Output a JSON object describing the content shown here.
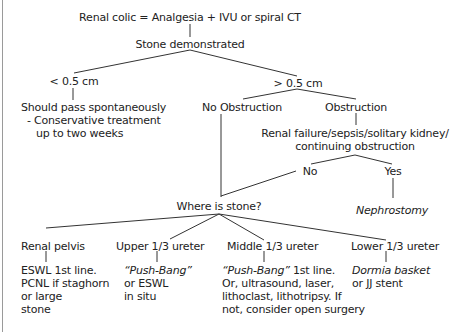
{
  "diagram": {
    "type": "flowchart",
    "title": "Renal colic = Analgesia + IVU or spiral CT",
    "nodes": {
      "stone_demonstrated": "Stone demonstrated",
      "lt_05": "< 0.5 cm",
      "lt_05_outcome": [
        "Should pass spontaneously",
        "- Conservative treatment",
        "up to two weeks"
      ],
      "gt_05": "> 0.5 cm",
      "no_obstruction": "No Obstruction",
      "obstruction": "Obstruction",
      "complications": [
        "Renal failure/sepsis/solitary kidney/",
        "continuing obstruction"
      ],
      "no": "No",
      "yes": "Yes",
      "nephrostomy": "Nephrostomy",
      "where_is_stone": "Where is stone?",
      "locations": [
        {
          "label": "Renal pelvis",
          "treatment": [
            "ESWL 1st line.",
            "PCNL if staghorn",
            "or large",
            "stone"
          ]
        },
        {
          "label": "Upper 1/3 ureter",
          "treatment_italic": "“Push-Bang”",
          "treatment": [
            "or ESWL",
            "in situ"
          ]
        },
        {
          "label": "Middle 1/3 ureter",
          "treatment_italic": "“Push-Bang”",
          "treatment_first_suffix": " 1st line.",
          "treatment": [
            "Or, ultrasound, laser,",
            "lithoclast, lithotripsy. If",
            "not, consider open surgery"
          ]
        },
        {
          "label": "Lower 1/3 ureter",
          "treatment_italic": "Dormia basket",
          "treatment": [
            "or JJ stent"
          ]
        }
      ]
    },
    "edges": [
      [
        "title",
        "stone_demonstrated"
      ],
      [
        "stone_demonstrated",
        "lt_05"
      ],
      [
        "stone_demonstrated",
        "gt_05"
      ],
      [
        "lt_05",
        "lt_05_outcome"
      ],
      [
        "gt_05",
        "no_obstruction"
      ],
      [
        "gt_05",
        "obstruction"
      ],
      [
        "obstruction",
        "complications"
      ],
      [
        "complications",
        "no"
      ],
      [
        "complications",
        "yes"
      ],
      [
        "yes",
        "nephrostomy"
      ],
      [
        "no",
        "where_is_stone"
      ],
      [
        "no_obstruction",
        "where_is_stone"
      ],
      [
        "where_is_stone",
        "Renal pelvis"
      ],
      [
        "where_is_stone",
        "Upper 1/3 ureter"
      ],
      [
        "where_is_stone",
        "Middle 1/3 ureter"
      ],
      [
        "where_is_stone",
        "Lower 1/3 ureter"
      ]
    ],
    "colors": {
      "text": "#222222",
      "line": "#333333",
      "background": "#ffffff",
      "left_rule": "#9a9a9a"
    }
  }
}
